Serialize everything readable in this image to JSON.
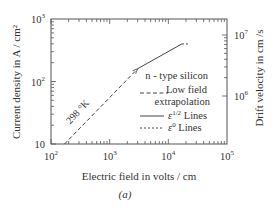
{
  "chart_data": {
    "type": "line",
    "title": "",
    "caption": "(a)",
    "xlabel": "Electric field in volts / cm",
    "ylabel": "Current density in A / cm²",
    "y2label": "Drift velocity in cm /s",
    "xscale": "log",
    "yscale": "log",
    "xlim": [
      100,
      100000
    ],
    "ylim": [
      10,
      1000
    ],
    "y2lim_note": "right axis log scale",
    "x_ticks": [
      {
        "value": 100,
        "base": "10",
        "exp": "2"
      },
      {
        "value": 1000,
        "base": "10",
        "exp": "3"
      },
      {
        "value": 10000,
        "base": "10",
        "exp": "4"
      },
      {
        "value": 100000,
        "base": "10",
        "exp": "5"
      }
    ],
    "y_ticks": [
      {
        "value": 10,
        "base": "10",
        "exp": ""
      },
      {
        "value": 100,
        "base": "10",
        "exp": "2"
      },
      {
        "value": 1000,
        "base": "10",
        "exp": "3"
      }
    ],
    "y2_ticks": [
      {
        "value": 10000000,
        "base": "10",
        "exp": "7",
        "at_y": 380
      },
      {
        "value": 1000000,
        "base": "10",
        "exp": "6",
        "at_y": 40
      }
    ],
    "series": [
      {
        "name": "Low field extrapolation",
        "style": "dashed",
        "points": [
          [
            170,
            10
          ],
          [
            3000,
            160
          ]
        ]
      },
      {
        "name": "ε 1/2 Lines",
        "style": "solid",
        "points": [
          [
            3000,
            160
          ],
          [
            17000,
            400
          ]
        ]
      },
      {
        "name": "ε 0 Lines",
        "style": "dotted",
        "points": [
          [
            17000,
            400
          ],
          [
            22000,
            400
          ]
        ]
      }
    ],
    "annotations": [
      {
        "text": "298 °K",
        "near": [
          900,
          40
        ]
      },
      {
        "text": "n - type silicon"
      }
    ],
    "legend": {
      "placement": "right-center",
      "title": "n - type silicon",
      "entries": [
        {
          "label_lines": [
            "Low field",
            "extrapolation"
          ],
          "style": "dashed"
        },
        {
          "label": "ε",
          "sup": "1/2",
          "suffix": " Lines",
          "style": "solid"
        },
        {
          "label": "ε",
          "sup": "0",
          "suffix": " Lines",
          "style": "dotted"
        }
      ]
    },
    "grid": false
  }
}
